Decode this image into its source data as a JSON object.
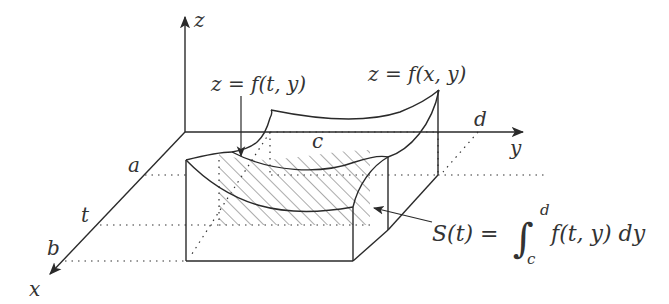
{
  "diagram": {
    "axes": {
      "x": "x",
      "y": "y",
      "z": "z"
    },
    "x_ticks": [
      "a",
      "t",
      "b"
    ],
    "y_ticks": [
      "c",
      "d"
    ],
    "labels": {
      "surface": "z = f(x, y)",
      "slice_curve": "z = f(t, y)",
      "area_lhs": "S(t) =",
      "integral_upper": "d",
      "integral_lower": "c",
      "integrand": "f(t, y) dy"
    },
    "colors": {
      "stroke": "#2a2a2a",
      "text": "#333333",
      "background": "#ffffff"
    }
  }
}
